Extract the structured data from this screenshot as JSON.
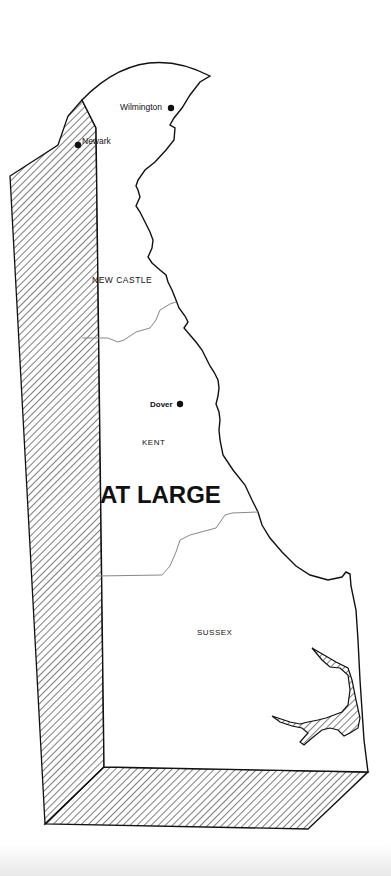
{
  "map": {
    "subject": "Delaware congressional district",
    "district_label": "AT LARGE",
    "counties": [
      {
        "name": "NEW CASTLE"
      },
      {
        "name": "KENT"
      },
      {
        "name": "SUSSEX"
      }
    ],
    "cities": [
      {
        "name": "Wilmington"
      },
      {
        "name": "Newark"
      },
      {
        "name": "Dover"
      }
    ],
    "colors": {
      "line": "#111111",
      "background": "#ffffff",
      "county_border": "#888888"
    }
  }
}
